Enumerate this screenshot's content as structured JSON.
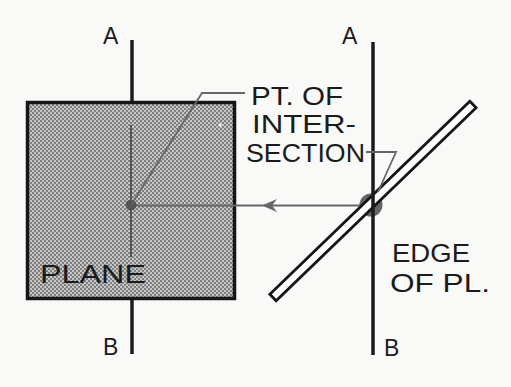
{
  "diagram": {
    "left_view": {
      "label_top": "A",
      "label_bottom": "B",
      "plane_label": "PLANE"
    },
    "right_view": {
      "label_top": "A",
      "label_bottom": "B",
      "edge_label": [
        "EDGE",
        "OF PL."
      ]
    },
    "callout": {
      "lines": [
        "PT. OF",
        "INTER-",
        "SECTION"
      ]
    }
  },
  "colors": {
    "ink": "#1b1b1b",
    "construction_line": "#666666",
    "plane_fill_light": "#c9c9c9",
    "plane_fill_dark": "#7d7d7d",
    "intersection_dot": "#4a4a4a",
    "paper": "#f9f9f8"
  }
}
